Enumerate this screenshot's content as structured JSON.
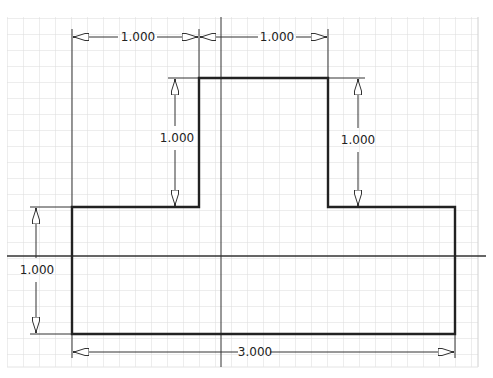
{
  "sketch": {
    "colors": {
      "background": "#ffffff",
      "grid": "#dcdcdc",
      "profile": "#222222",
      "axis": "#333333",
      "dimension": "#333333"
    },
    "grid": {
      "left": 7,
      "top": 17,
      "right": 478,
      "bottom": 367,
      "spacing": 16
    },
    "axes": {
      "vertical_x": 221,
      "horizontal_y": 256
    },
    "dimensions": [
      {
        "id": "top-left-width",
        "label": "1.000"
      },
      {
        "id": "top-right-width",
        "label": "1.000"
      },
      {
        "id": "left-step-height",
        "label": "1.000"
      },
      {
        "id": "right-step-height",
        "label": "1.000"
      },
      {
        "id": "base-height",
        "label": "1.000"
      },
      {
        "id": "overall-width",
        "label": "3.000"
      }
    ]
  }
}
